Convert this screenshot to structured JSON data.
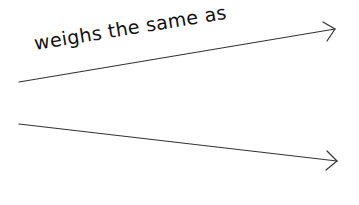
{
  "diagram": {
    "label": "weighs the same as",
    "colors": {
      "stroke": "#333333",
      "text": "#111111",
      "background": "#ffffff"
    },
    "arrows": [
      {
        "name": "top-arrow",
        "x1": 19,
        "y1": 82,
        "x2": 335,
        "y2": 29,
        "barb1": [
          323,
          22
        ],
        "barb2": [
          327,
          41
        ]
      },
      {
        "name": "bottom-arrow",
        "x1": 19,
        "y1": 124,
        "x2": 337,
        "y2": 161,
        "barb1": [
          327,
          151
        ],
        "barb2": [
          326,
          170
        ]
      }
    ]
  }
}
